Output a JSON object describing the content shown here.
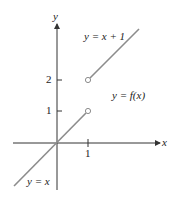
{
  "figure": {
    "axes": {
      "x_label": "x",
      "y_label": "y",
      "x_ticks": [
        {
          "value": 1,
          "label": "1"
        }
      ],
      "y_ticks": [
        {
          "value": 1,
          "label": "1"
        },
        {
          "value": 2,
          "label": "2"
        }
      ]
    },
    "curves": [
      {
        "label": "y = x",
        "domain": "x < 1",
        "open_endpoint": [
          1,
          1
        ]
      },
      {
        "label": "y = x + 1",
        "domain": "x > 1",
        "open_endpoint": [
          1,
          2
        ]
      }
    ],
    "function_label": "y = f(x)",
    "colors": {
      "curve": "#8c8c8c",
      "axis": "#333333",
      "text": "#222222"
    }
  }
}
